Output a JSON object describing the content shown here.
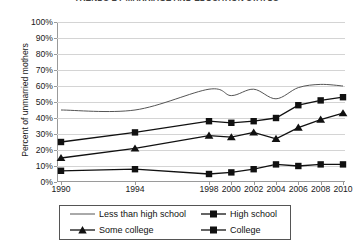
{
  "chart_data": {
    "type": "line",
    "title": "TRENDS BY MARRIAGE AND EDUCATION STATUS",
    "xlabel": "",
    "ylabel": "Percent of unmarried mothers",
    "x": [
      1990,
      1994,
      1998,
      2000,
      2002,
      2004,
      2006,
      2008,
      2010
    ],
    "xticklabels": [
      "1990",
      "1994",
      "1998",
      "2000",
      "2002",
      "2004",
      "2006",
      "2008",
      "2010"
    ],
    "yticklabels": [
      "0%",
      "10%",
      "20%",
      "30%",
      "40%",
      "50%",
      "60%",
      "70%",
      "80%",
      "90%",
      "100%"
    ],
    "yticks": [
      0,
      10,
      20,
      30,
      40,
      50,
      60,
      70,
      80,
      90,
      100
    ],
    "ylim": [
      0,
      100
    ],
    "grid": "horizontal",
    "legend_position": "below-axes",
    "series": [
      {
        "name": "Less than high school",
        "marker": "none",
        "color": "#555555",
        "values": [
          45,
          45,
          58,
          54,
          58,
          52,
          59,
          61,
          60
        ]
      },
      {
        "name": "High school",
        "marker": "square",
        "color": "#111111",
        "values": [
          25,
          31,
          38,
          37,
          38,
          40,
          48,
          51,
          53
        ]
      },
      {
        "name": "Some college",
        "marker": "triangle",
        "color": "#111111",
        "values": [
          15,
          21,
          29,
          28,
          31,
          27,
          34,
          39,
          43
        ]
      },
      {
        "name": "College",
        "marker": "square",
        "color": "#111111",
        "values": [
          7,
          8,
          5,
          6,
          8,
          11,
          10,
          11,
          11
        ]
      }
    ]
  },
  "legend": {
    "entries": [
      {
        "label": "Less than high school",
        "marker": "none"
      },
      {
        "label": "High school",
        "marker": "square"
      },
      {
        "label": "Some college",
        "marker": "triangle"
      },
      {
        "label": "College",
        "marker": "square"
      }
    ]
  }
}
